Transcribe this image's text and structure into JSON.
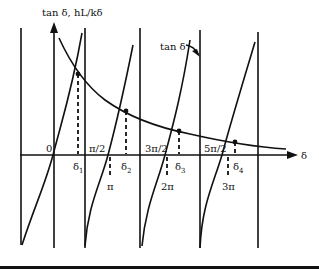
{
  "figure": {
    "y_axis_label": "tan δ, hL/kδ",
    "x_axis_label": "δ",
    "curve_label": "tan δ",
    "origin_label": "0",
    "asymptote_labels": [
      "π/2",
      "3π/2",
      "5π/2"
    ],
    "root_labels": [
      "δ1",
      "δ2",
      "δ3",
      "δ4"
    ],
    "root_subscripts": [
      "1",
      "2",
      "3",
      "4"
    ],
    "multiple_labels": [
      "π",
      "2π",
      "3π"
    ],
    "root_symbol": "δ",
    "colors": {
      "line": "#111111",
      "background": "#ffffff"
    }
  }
}
